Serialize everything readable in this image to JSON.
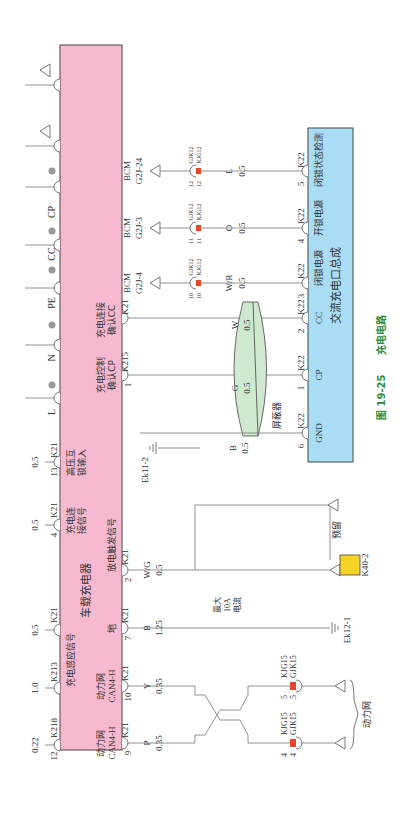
{
  "figure": {
    "caption_number": "图 19-25",
    "caption_title": "充电电路",
    "orientation": "rotated 90° counter-clockwise"
  },
  "colors": {
    "charger_box": "#f7b9cf",
    "charge_port_box": "#a9dcf5",
    "shield": "#cfe9cf",
    "connector_red": "#e8462a",
    "k40_yellow": "#f5d327",
    "caption_green": "#2e8b3a"
  },
  "charger": {
    "title": "车载充电器",
    "labels": {
      "sense_signal": "充电感应信号",
      "connect_signal_a": "充电连",
      "connect_signal_b": "接信号",
      "hv_interlock_a": "高压互",
      "hv_interlock_b": "锁输入",
      "cp_confirm_a": "充电控制",
      "cp_confirm_b": "确认CP",
      "cc_confirm_a": "充电连接",
      "cc_confirm_b": "确认CC",
      "ground": "地",
      "discharge_trigger": "放电触发信号",
      "can_a1": "动力网",
      "can_a2": "CAN4-H",
      "can_b1": "动力网",
      "can_b2": "CAN4-H"
    },
    "top_pins": [
      {
        "label": "L"
      },
      {
        "label": "N"
      },
      {
        "label": "PE"
      },
      {
        "label": "CC"
      },
      {
        "label": "CP"
      }
    ],
    "top_wires": [
      {
        "pin": "13",
        "conn": "K21",
        "gauge": "0.5"
      },
      {
        "pin": "4",
        "conn": "K21",
        "gauge": "0.5"
      },
      {
        "pin": "",
        "conn": "K21",
        "gauge": "0.5"
      },
      {
        "pin": "",
        "conn": "K213",
        "gauge": "1.0"
      },
      {
        "pin": "12",
        "conn": "K218",
        "gauge": "0.22"
      }
    ],
    "side_pins": [
      {
        "pin": "",
        "conn": "K21",
        "color": "",
        "gauge": ""
      },
      {
        "pin": "1",
        "conn": "K215",
        "color": "",
        "gauge": ""
      },
      {
        "pin": "2",
        "conn": "K21",
        "color": "W/G",
        "gauge": "0.5"
      },
      {
        "pin": "7",
        "conn": "K21",
        "color": "B",
        "gauge": "1.25"
      },
      {
        "pin": "10",
        "conn": "K21",
        "color": "Y",
        "gauge": "0.35"
      },
      {
        "pin": "9",
        "conn": "K21",
        "color": "P",
        "gauge": "0.35"
      }
    ]
  },
  "bcm": [
    {
      "name": "BCM",
      "pin": "G2J-24",
      "conn_a": "GJK12",
      "conn_b": "KJG12",
      "num_a": "12",
      "num_b": "12",
      "color": "L",
      "gauge": "0.5"
    },
    {
      "name": "BCM",
      "pin": "G2J-3",
      "conn_a": "GJK12",
      "conn_b": "KJG12",
      "num_a": "11",
      "num_b": "11",
      "color": "O",
      "gauge": "0.5"
    },
    {
      "name": "BCM",
      "pin": "G2J-4",
      "conn_a": "GJK12",
      "conn_b": "KJG12",
      "num_a": "10",
      "num_b": "10",
      "color": "W/R",
      "gauge": "0.5"
    }
  ],
  "shield": {
    "label": "屏蔽器",
    "wires": [
      {
        "color": "W",
        "gauge": "0.5"
      },
      {
        "color": "G",
        "gauge": "0.5"
      },
      {
        "color": "B",
        "gauge": "0.5"
      }
    ]
  },
  "ground_ek11": "Ek11-2",
  "ground_ek12": "Ek12-1",
  "max_current": {
    "a": "最大",
    "b": "10A",
    "c": "电流"
  },
  "reserved": "预留",
  "k40": "K40-2",
  "can_network": "动力网",
  "can_connectors": [
    {
      "num": "4",
      "a": "KJG15",
      "b": "GJK15"
    },
    {
      "num": "5",
      "a": "KJG15",
      "b": "GJK15"
    }
  ],
  "charge_port": {
    "title": "交流充电口总成",
    "pins": [
      {
        "pin": "5",
        "conn": "K22",
        "label": "闭锁状态检测"
      },
      {
        "pin": "4",
        "conn": "K22",
        "label": "开锁电源"
      },
      {
        "pin": "3",
        "conn": "K22",
        "label": "闭锁电源"
      },
      {
        "pin": "2",
        "conn": "K22",
        "label": "CC"
      },
      {
        "pin": "1",
        "conn": "K22",
        "label": "CP"
      },
      {
        "pin": "6",
        "conn": "K22",
        "label": "GND"
      }
    ]
  }
}
